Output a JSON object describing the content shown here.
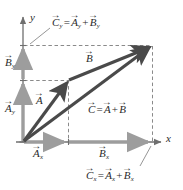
{
  "figure": {
    "type": "vector-addition-diagram",
    "axes": {
      "x_label": "x",
      "y_label": "y"
    },
    "colors": {
      "vector": "#4a4a4a",
      "component_arrow": "#9a9a9a",
      "axis": "#6f6f6f",
      "dashed": "#8a8a8a",
      "text": "#2b2b2b"
    },
    "labels": {
      "vector_a": {
        "base": "A",
        "accent": "→"
      },
      "vector_b": {
        "base": "B",
        "accent": "→"
      },
      "vector_c": {
        "base": "C",
        "accent": "→"
      },
      "a_x": {
        "base": "A",
        "sub": "x"
      },
      "a_y": {
        "base": "A",
        "sub": "y"
      },
      "b_x": {
        "base": "B",
        "sub": "x"
      },
      "b_y": {
        "base": "B",
        "sub": "y"
      },
      "c_x": {
        "base": "C",
        "sub": "x"
      },
      "c_y": {
        "base": "C",
        "sub": "y"
      },
      "equals": "=",
      "plus": "+"
    },
    "equations": {
      "resultant": "C = A + B",
      "y_components": "Cy = Ay + By",
      "x_components": "Cx = Ax + Bx"
    },
    "geometry": {
      "origin": [
        23,
        142
      ],
      "a_tip": [
        68,
        80
      ],
      "c_tip": [
        152,
        45
      ],
      "x_axis_end": [
        160,
        142
      ],
      "y_axis_end": [
        23,
        15
      ]
    }
  }
}
